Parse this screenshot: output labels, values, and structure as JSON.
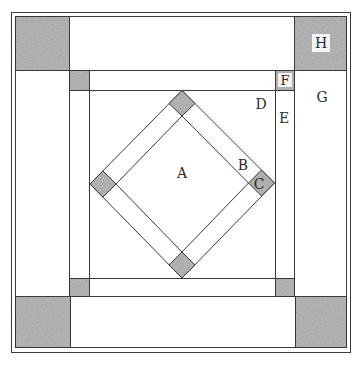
{
  "diagram": {
    "title": "",
    "type": "quilt block piecing diagram",
    "colors": {
      "line": "#3a3a3a",
      "shaded": "#bdbdbd",
      "shaded_dark": "#a8a8a8",
      "background": "#ffffff"
    },
    "labels": {
      "A": "A",
      "B": "B",
      "C": "C",
      "D": "D",
      "E": "E",
      "F": "F",
      "G": "G",
      "H": "H"
    },
    "pieces": [
      {
        "id": "A",
        "description": "center square set on point"
      },
      {
        "id": "B",
        "description": "sashing strips around center diamond"
      },
      {
        "id": "C",
        "description": "small shaded cornerstones of diamond"
      },
      {
        "id": "D",
        "description": "setting triangles forming inner square"
      },
      {
        "id": "E",
        "description": "inner border strips"
      },
      {
        "id": "F",
        "description": "small shaded inner border corners"
      },
      {
        "id": "G",
        "description": "outer border strips"
      },
      {
        "id": "H",
        "description": "large shaded outer border corners"
      }
    ]
  }
}
